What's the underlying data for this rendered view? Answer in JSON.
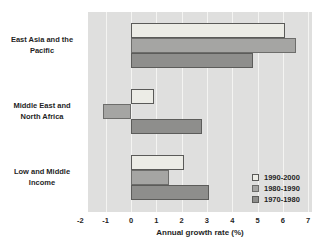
{
  "chart_data": {
    "type": "bar",
    "orientation": "horizontal",
    "title": "",
    "xlabel": "Annual growth rate (%)",
    "ylabel": "",
    "categories": [
      [
        "East Asia and the",
        "Pacific"
      ],
      [
        "Middle East and",
        "North Africa"
      ],
      [
        "Low and Middle",
        "Income"
      ]
    ],
    "series": [
      {
        "name": "1990-2000",
        "values": [
          6.1,
          0.9,
          2.1
        ],
        "fill": "#ecece6",
        "border": "#5a5a58"
      },
      {
        "name": "1980-1990",
        "values": [
          6.5,
          -1.1,
          1.5
        ],
        "fill": "#a5a5a3",
        "border": "#6d6d6b"
      },
      {
        "name": "1970-1980",
        "values": [
          4.8,
          2.8,
          3.1
        ],
        "fill": "#8e8e8c",
        "border": "#5c5c5a"
      }
    ],
    "xlim": [
      -1.7,
      7.15
    ],
    "xticks": [
      -2,
      -1,
      0,
      1,
      2,
      3,
      4,
      5,
      6,
      7
    ],
    "grid": true,
    "legend_position": "bottom-right",
    "colors": {
      "plot_bg": "#dfdfde",
      "gridline": "#f4f4f2",
      "text": "#1f1f1f"
    }
  }
}
